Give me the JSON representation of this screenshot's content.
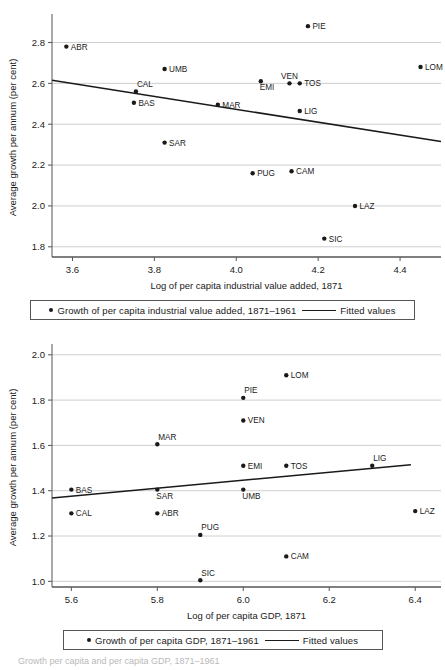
{
  "charts": [
    {
      "id": "industrial-value-added",
      "type": "scatter",
      "title": "",
      "xlabel": "Log of per capita industrial value added, 1871",
      "ylabel": "Average growth per annum (per cent)",
      "xlim": [
        3.55,
        4.5
      ],
      "ylim": [
        1.75,
        2.92
      ],
      "xticks": [
        "3.6",
        "3.8",
        "4.0",
        "4.2",
        "4.4"
      ],
      "xtickvals": [
        3.6,
        3.8,
        4.0,
        4.2,
        4.4
      ],
      "yticks": [
        "2.8",
        "2.6",
        "2.4",
        "2.2",
        "2.0",
        "1.8"
      ],
      "ytickvals": [
        2.8,
        2.6,
        2.4,
        2.2,
        2.0,
        1.8
      ],
      "grid": "horizontal",
      "points": [
        {
          "label": "ABR",
          "x": 3.585,
          "y": 2.78,
          "lpos": "right"
        },
        {
          "label": "PIE",
          "x": 4.175,
          "y": 2.88,
          "lpos": "right"
        },
        {
          "label": "LOM",
          "x": 4.45,
          "y": 2.68,
          "lpos": "right"
        },
        {
          "label": "UMB",
          "x": 3.825,
          "y": 2.67,
          "lpos": "right"
        },
        {
          "label": "CAL",
          "x": 3.755,
          "y": 2.56,
          "lpos": "above-right"
        },
        {
          "label": "EMI",
          "x": 4.06,
          "y": 2.61,
          "lpos": "below-right"
        },
        {
          "label": "VEN",
          "x": 4.13,
          "y": 2.6,
          "lpos": "above"
        },
        {
          "label": "TOS",
          "x": 4.155,
          "y": 2.6,
          "lpos": "right"
        },
        {
          "label": "BAS",
          "x": 3.75,
          "y": 2.505,
          "lpos": "right"
        },
        {
          "label": "MAR",
          "x": 3.955,
          "y": 2.495,
          "lpos": "right"
        },
        {
          "label": "LIG",
          "x": 4.155,
          "y": 2.465,
          "lpos": "right"
        },
        {
          "label": "SAR",
          "x": 3.825,
          "y": 2.31,
          "lpos": "right"
        },
        {
          "label": "PUG",
          "x": 4.04,
          "y": 2.16,
          "lpos": "right"
        },
        {
          "label": "CAM",
          "x": 4.135,
          "y": 2.17,
          "lpos": "right"
        },
        {
          "label": "LAZ",
          "x": 4.29,
          "y": 2.0,
          "lpos": "right"
        },
        {
          "label": "SIC",
          "x": 4.215,
          "y": 1.84,
          "lpos": "right"
        }
      ],
      "fit": {
        "x0": 3.55,
        "y0": 2.615,
        "x1": 4.5,
        "y1": 2.315
      },
      "legend": {
        "series_label": "Growth of per capita industrial value added, 1871–1961",
        "fit_label": "Fitted values"
      }
    },
    {
      "id": "gdp",
      "type": "scatter",
      "title": "",
      "xlabel": "Log of per capita GDP, 1871",
      "ylabel": "Average growth per annum (per cent)",
      "xlim": [
        5.555,
        6.46
      ],
      "ylim": [
        0.975,
        2.03
      ],
      "xticks": [
        "5.6",
        "5.8",
        "6.0",
        "6.2",
        "6.4"
      ],
      "xtickvals": [
        5.6,
        5.8,
        6.0,
        6.2,
        6.4
      ],
      "yticks": [
        "2.0",
        "1.8",
        "1.6",
        "1.4",
        "1.2",
        "1.0"
      ],
      "ytickvals": [
        2.0,
        1.8,
        1.6,
        1.4,
        1.2,
        1.0
      ],
      "grid": "horizontal",
      "points": [
        {
          "label": "LOM",
          "x": 6.1,
          "y": 1.91,
          "lpos": "right"
        },
        {
          "label": "PIE",
          "x": 6.0,
          "y": 1.81,
          "lpos": "above-right"
        },
        {
          "label": "VEN",
          "x": 6.0,
          "y": 1.71,
          "lpos": "right"
        },
        {
          "label": "MAR",
          "x": 5.8,
          "y": 1.605,
          "lpos": "above-right"
        },
        {
          "label": "EMI",
          "x": 6.0,
          "y": 1.51,
          "lpos": "right"
        },
        {
          "label": "TOS",
          "x": 6.1,
          "y": 1.51,
          "lpos": "right"
        },
        {
          "label": "LIG",
          "x": 6.3,
          "y": 1.51,
          "lpos": "above-right"
        },
        {
          "label": "BAS",
          "x": 5.6,
          "y": 1.405,
          "lpos": "right"
        },
        {
          "label": "SAR",
          "x": 5.8,
          "y": 1.405,
          "lpos": "below-right"
        },
        {
          "label": "UMB",
          "x": 6.0,
          "y": 1.405,
          "lpos": "below-right"
        },
        {
          "label": "CAL",
          "x": 5.6,
          "y": 1.3,
          "lpos": "right"
        },
        {
          "label": "ABR",
          "x": 5.8,
          "y": 1.3,
          "lpos": "right"
        },
        {
          "label": "LAZ",
          "x": 6.4,
          "y": 1.31,
          "lpos": "right"
        },
        {
          "label": "PUG",
          "x": 5.9,
          "y": 1.205,
          "lpos": "above-right"
        },
        {
          "label": "CAM",
          "x": 6.1,
          "y": 1.11,
          "lpos": "right"
        },
        {
          "label": "SIC",
          "x": 5.9,
          "y": 1.005,
          "lpos": "above-right"
        }
      ],
      "fit": {
        "x0": 5.555,
        "y0": 1.368,
        "x1": 6.39,
        "y1": 1.515
      },
      "legend": {
        "series_label": "Growth of per capita GDP, 1871–1961",
        "fit_label": "Fitted values"
      }
    }
  ],
  "caption": "Growth per capita and per capita GDP, 1871–1961",
  "colors": {
    "ink": "#1a1a1a",
    "grid": "#c8c8c8",
    "axis": "#555555"
  }
}
